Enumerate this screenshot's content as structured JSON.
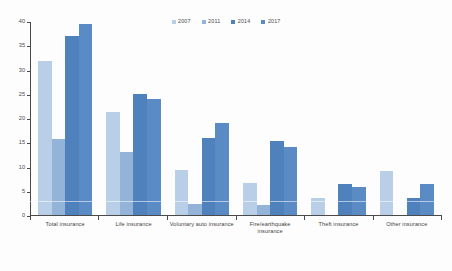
{
  "chart_data": {
    "type": "bar",
    "title": "",
    "subtitle": "",
    "xlabel": "",
    "ylabel": "",
    "ylim": [
      0,
      40
    ],
    "yticks": [
      0,
      5,
      10,
      15,
      20,
      25,
      30,
      35,
      40
    ],
    "grid": false,
    "legend_position": "top-center",
    "categories": [
      "Total insurance",
      "Life insurance",
      "Voluntary auto insurance",
      "Fire/earthquake insurance",
      "Theft insurance",
      "Other insurance"
    ],
    "series": [
      {
        "name": "2007",
        "color": "#b9cfe7",
        "values": [
          32.0,
          21.4,
          9.2,
          6.6,
          3.4,
          9.1
        ]
      },
      {
        "name": "2011",
        "color": "#93b4d8",
        "values": [
          15.8,
          13.0,
          2.2,
          2.0,
          0.0,
          0.0
        ]
      },
      {
        "name": "2014",
        "color": "#4f81bd",
        "values": [
          37.0,
          25.0,
          16.0,
          15.4,
          6.3,
          3.5
        ]
      },
      {
        "name": "2017",
        "color": "#5b8bc4",
        "values": [
          39.5,
          24.0,
          19.0,
          14.0,
          5.8,
          6.3
        ]
      }
    ]
  },
  "legend": {
    "items": [
      {
        "label": "2007"
      },
      {
        "label": "2011"
      },
      {
        "label": "2014"
      },
      {
        "label": "2017"
      }
    ]
  },
  "axis": {
    "y_tick_labels": [
      "0",
      "5",
      "10",
      "15",
      "20",
      "25",
      "30",
      "35",
      "40"
    ]
  }
}
